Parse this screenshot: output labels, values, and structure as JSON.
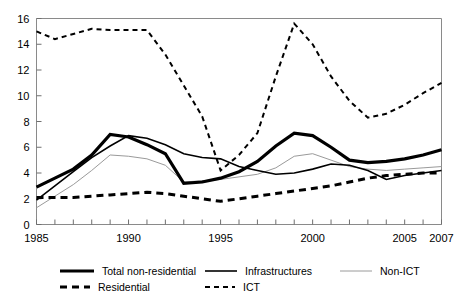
{
  "chart_data": {
    "type": "line",
    "title": "",
    "subtitle": "",
    "xlabel": "",
    "ylabel": "",
    "xlim": [
      1985,
      2007
    ],
    "ylim": [
      0,
      16
    ],
    "ytick_values": [
      0,
      2,
      4,
      6,
      8,
      10,
      12,
      14,
      16
    ],
    "ytick_labels": [
      "0",
      "2",
      "4",
      "6",
      "8",
      "10",
      "12",
      "14",
      "16"
    ],
    "xtick_values": [
      1985,
      1986,
      1987,
      1988,
      1989,
      1990,
      1991,
      1992,
      1993,
      1994,
      1995,
      1996,
      1997,
      1998,
      1999,
      2000,
      2001,
      2002,
      2003,
      2004,
      2005,
      2006,
      2007
    ],
    "xtick_labeled": [
      1985,
      1990,
      1995,
      2000,
      2005,
      2007
    ],
    "xtick_labels": [
      "1985",
      "1990",
      "1995",
      "2000",
      "2005",
      "2007"
    ],
    "grid": false,
    "legend_position": "bottom",
    "x": [
      1985,
      1986,
      1987,
      1988,
      1989,
      1990,
      1991,
      1992,
      1993,
      1994,
      1995,
      1996,
      1997,
      1998,
      1999,
      2000,
      2001,
      2002,
      2003,
      2004,
      2005,
      2006,
      2007
    ],
    "series": [
      {
        "name": "Total non-residential",
        "style": "solid-thick",
        "color": "#000000",
        "width": 3.2,
        "values": [
          2.9,
          3.6,
          4.3,
          5.4,
          7.0,
          6.8,
          6.2,
          5.5,
          3.2,
          3.3,
          3.6,
          4.1,
          4.9,
          6.1,
          7.1,
          6.9,
          6.0,
          5.0,
          4.8,
          4.9,
          5.1,
          5.4,
          5.8
        ]
      },
      {
        "name": "Infrastructures",
        "style": "solid-medium",
        "color": "#000000",
        "width": 1.6,
        "values": [
          1.9,
          3.0,
          4.1,
          5.2,
          6.1,
          6.9,
          6.7,
          6.2,
          5.5,
          5.2,
          5.1,
          4.5,
          4.2,
          3.9,
          4.0,
          4.3,
          4.7,
          4.6,
          4.2,
          3.5,
          3.8,
          4.0,
          4.2
        ]
      },
      {
        "name": "Non-ICT",
        "style": "solid-thin",
        "color": "#9a9a9a",
        "width": 1.0,
        "values": [
          1.3,
          2.2,
          3.1,
          4.2,
          5.4,
          5.3,
          5.1,
          4.6,
          3.3,
          3.4,
          3.5,
          3.7,
          3.9,
          4.4,
          5.3,
          5.5,
          5.0,
          4.5,
          4.3,
          4.2,
          4.3,
          4.4,
          4.5
        ]
      },
      {
        "name": "Residential",
        "style": "dashed-thick",
        "color": "#000000",
        "width": 3.0,
        "values": [
          2.1,
          2.1,
          2.1,
          2.2,
          2.3,
          2.4,
          2.5,
          2.4,
          2.2,
          2.0,
          1.8,
          2.0,
          2.2,
          2.4,
          2.6,
          2.8,
          3.0,
          3.3,
          3.6,
          3.8,
          3.9,
          4.0,
          4.0
        ]
      },
      {
        "name": "ICT",
        "style": "dashed-thin",
        "color": "#000000",
        "width": 2.0,
        "values": [
          15.0,
          14.4,
          14.8,
          15.2,
          15.1,
          15.1,
          15.1,
          13.2,
          10.8,
          8.4,
          4.2,
          5.4,
          7.1,
          11.5,
          15.6,
          14.0,
          11.5,
          9.6,
          8.3,
          8.6,
          9.3,
          10.2,
          11.0
        ]
      }
    ],
    "legend": [
      {
        "label": "Total non-residential",
        "style": "solid-thick"
      },
      {
        "label": "Infrastructures",
        "style": "solid-medium"
      },
      {
        "label": "Non-ICT",
        "style": "solid-thin"
      },
      {
        "label": "Residential",
        "style": "dashed-thick"
      },
      {
        "label": "ICT",
        "style": "dashed-thin"
      }
    ]
  }
}
